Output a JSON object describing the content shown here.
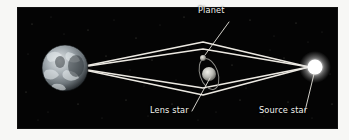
{
  "figure": {
    "type": "astronomy-diagram",
    "panel": {
      "background_color": "#040404",
      "mat_color": "#f7f7f5"
    }
  },
  "labels": {
    "planet": "Planet",
    "lens_star": "Lens star",
    "source_star": "Source star"
  },
  "objects": {
    "earth": {
      "name": "earth-sphere",
      "cx": 47,
      "cy": 60,
      "r": 23,
      "color": "#9aa3a8"
    },
    "lens_star": {
      "name": "lens-star-sphere",
      "cx": 191,
      "cy": 66,
      "r": 7,
      "color": "#c9c9c4"
    },
    "planet": {
      "name": "planet-dot",
      "cx": 185,
      "cy": 50,
      "r": 3,
      "color": "#b8b8b2"
    },
    "source_star": {
      "name": "source-star-glow",
      "cx": 297,
      "cy": 59,
      "r": 9,
      "color": "#ffffff"
    },
    "orbit": {
      "name": "planet-orbit-ellipse",
      "cx": 191,
      "cy": 66,
      "rx": 9,
      "ry": 16,
      "rotation": -18,
      "color": "#8d8d88"
    }
  },
  "light_paths": {
    "color": "#ece9e2",
    "stroke_width": 1.6,
    "earth_vertex": {
      "x": 57,
      "y": 60
    },
    "source_vertex": {
      "x": 291,
      "y": 59
    },
    "top_vertex": {
      "x": 185,
      "y": 34
    },
    "bottom_vertex": {
      "x": 185,
      "y": 87
    },
    "description": "two bent light rays from the source star deflected around the lens star converging at Earth"
  },
  "leader_lines": {
    "color": "#e8e5de",
    "stroke_width": 0.9,
    "planet": {
      "x1": 211,
      "y1": 14,
      "x2": 187,
      "y2": 47
    },
    "lens_star": {
      "x1": 174,
      "y1": 103,
      "x2": 192,
      "y2": 70
    },
    "source_star": {
      "x1": 287,
      "y1": 103,
      "x2": 296,
      "y2": 66
    }
  },
  "starfield": {
    "color": "#5a5a55",
    "count": 42
  }
}
